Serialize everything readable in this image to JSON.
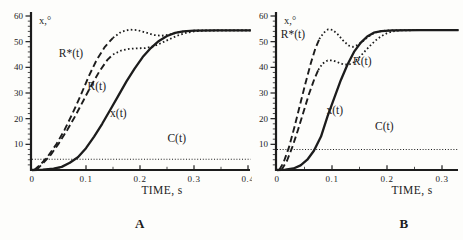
{
  "figure": {
    "background": "#fdfdfb",
    "ink": "#1c1c1c"
  },
  "chart_data": [
    {
      "type": "line",
      "panel_label": "A",
      "ylabel": "x,°",
      "xlabel": "TIME, s",
      "xlim": [
        0,
        0.4
      ],
      "ylim": [
        0,
        60
      ],
      "xtick_labels": [
        "0",
        "0.1",
        "0.2",
        "0.3",
        "0.4"
      ],
      "xtick_values": [
        0,
        0.1,
        0.2,
        0.3,
        0.4
      ],
      "ytick_labels": [
        "10",
        "20",
        "30",
        "40",
        "50",
        "60"
      ],
      "ytick_values": [
        10,
        20,
        30,
        40,
        50,
        60
      ],
      "x_minor_step": 0.05,
      "y_minor_step": 2,
      "steady_state_value": 54.4,
      "series": [
        {
          "name": "R*(t)",
          "segment": "rise",
          "style": "dashed",
          "points": [
            [
              0.004,
              0
            ],
            [
              0.015,
              2
            ],
            [
              0.03,
              5.5
            ],
            [
              0.045,
              10
            ],
            [
              0.06,
              15.5
            ],
            [
              0.075,
              22
            ],
            [
              0.09,
              29
            ],
            [
              0.105,
              36.5
            ],
            [
              0.12,
              43
            ],
            [
              0.135,
              48
            ],
            [
              0.15,
              51.5
            ]
          ]
        },
        {
          "name": "R*(t)",
          "segment": "settle",
          "style": "dotted",
          "points": [
            [
              0.15,
              51.5
            ],
            [
              0.165,
              53.8
            ],
            [
              0.18,
              54.7
            ],
            [
              0.195,
              54.5
            ],
            [
              0.21,
              53.6
            ],
            [
              0.225,
              52.6
            ],
            [
              0.24,
              52.3
            ],
            [
              0.255,
              52.8
            ],
            [
              0.27,
              53.6
            ],
            [
              0.285,
              54.1
            ],
            [
              0.31,
              54.4
            ],
            [
              0.35,
              54.4
            ],
            [
              0.405,
              54.4
            ]
          ]
        },
        {
          "name": "R(t)",
          "segment": "rise",
          "style": "dashed",
          "points": [
            [
              0.008,
              0
            ],
            [
              0.02,
              2.5
            ],
            [
              0.035,
              6
            ],
            [
              0.05,
              10.5
            ],
            [
              0.065,
              15.5
            ],
            [
              0.08,
              21
            ],
            [
              0.095,
              27
            ],
            [
              0.11,
              33
            ],
            [
              0.125,
              38.5
            ],
            [
              0.14,
              43
            ],
            [
              0.15,
              45
            ]
          ]
        },
        {
          "name": "R(t)",
          "segment": "settle",
          "style": "dotted",
          "points": [
            [
              0.15,
              45
            ],
            [
              0.165,
              46.5
            ],
            [
              0.18,
              47.2
            ],
            [
              0.195,
              47.4
            ],
            [
              0.21,
              47.5
            ],
            [
              0.225,
              48.2
            ],
            [
              0.24,
              49.5
            ],
            [
              0.255,
              51
            ],
            [
              0.27,
              52.4
            ],
            [
              0.285,
              53.4
            ],
            [
              0.3,
              54
            ],
            [
              0.32,
              54.3
            ],
            [
              0.36,
              54.4
            ],
            [
              0.405,
              54.4
            ]
          ]
        },
        {
          "name": "x(t)",
          "segment": "full",
          "style": "solid",
          "points": [
            [
              0,
              0
            ],
            [
              0.02,
              0.1
            ],
            [
              0.04,
              0.5
            ],
            [
              0.055,
              1.2
            ],
            [
              0.07,
              2.8
            ],
            [
              0.085,
              5
            ],
            [
              0.1,
              8.5
            ],
            [
              0.115,
              13
            ],
            [
              0.13,
              18
            ],
            [
              0.145,
              23.5
            ],
            [
              0.16,
              29
            ],
            [
              0.175,
              34.5
            ],
            [
              0.19,
              39.5
            ],
            [
              0.205,
              44
            ],
            [
              0.22,
              47.5
            ],
            [
              0.235,
              50.3
            ],
            [
              0.25,
              52.2
            ],
            [
              0.265,
              53.4
            ],
            [
              0.28,
              54
            ],
            [
              0.3,
              54.3
            ],
            [
              0.34,
              54.4
            ],
            [
              0.405,
              54.4
            ]
          ]
        },
        {
          "name": "C(t)",
          "segment": "full",
          "style": "cline",
          "points": [
            [
              0,
              4.2
            ],
            [
              0.405,
              4.2
            ]
          ]
        }
      ],
      "labels": [
        {
          "text": "R*(t)",
          "x": 0.072,
          "y": 44
        },
        {
          "text": "R(t)",
          "x": 0.12,
          "y": 31
        },
        {
          "text": "x(t)",
          "x": 0.16,
          "y": 20.5
        },
        {
          "text": "C(t)",
          "x": 0.268,
          "y": 11
        }
      ]
    },
    {
      "type": "line",
      "panel_label": "B",
      "ylabel": "x,°",
      "xlabel": "TIME, s",
      "xlim": [
        0,
        0.3
      ],
      "ylim": [
        0,
        60
      ],
      "xtick_labels": [
        "0",
        "0.1",
        "0.2",
        "0.3"
      ],
      "xtick_values": [
        0,
        0.1,
        0.2,
        0.3
      ],
      "ytick_labels": [
        "10",
        "20",
        "30",
        "40",
        "50",
        "60"
      ],
      "ytick_values": [
        10,
        20,
        30,
        40,
        50,
        60
      ],
      "x_minor_step": 0.05,
      "y_minor_step": 2,
      "steady_state_value": 54.5,
      "series": [
        {
          "name": "R*(t)",
          "segment": "rise",
          "style": "dashed",
          "points": [
            [
              0.004,
              0
            ],
            [
              0.012,
              3
            ],
            [
              0.022,
              9
            ],
            [
              0.032,
              17
            ],
            [
              0.042,
              25.5
            ],
            [
              0.052,
              34
            ],
            [
              0.062,
              42
            ],
            [
              0.07,
              47.5
            ],
            [
              0.077,
              51
            ]
          ]
        },
        {
          "name": "R*(t)",
          "segment": "settle",
          "style": "dotted",
          "points": [
            [
              0.077,
              51
            ],
            [
              0.085,
              53.5
            ],
            [
              0.093,
              54.8
            ],
            [
              0.101,
              54.6
            ],
            [
              0.11,
              53
            ],
            [
              0.12,
              50.5
            ],
            [
              0.13,
              48.5
            ],
            [
              0.138,
              48
            ],
            [
              0.147,
              48.7
            ],
            [
              0.156,
              50.2
            ],
            [
              0.165,
              51.8
            ],
            [
              0.175,
              53.2
            ],
            [
              0.185,
              54
            ],
            [
              0.2,
              54.4
            ],
            [
              0.24,
              54.5
            ],
            [
              0.33,
              54.5
            ]
          ]
        },
        {
          "name": "R(t)",
          "segment": "rise",
          "style": "dashed",
          "points": [
            [
              0.008,
              0
            ],
            [
              0.018,
              3.5
            ],
            [
              0.028,
              9
            ],
            [
              0.038,
              15.5
            ],
            [
              0.048,
              22.5
            ],
            [
              0.058,
              29.5
            ],
            [
              0.068,
              35.5
            ],
            [
              0.075,
              39
            ]
          ]
        },
        {
          "name": "R(t)",
          "segment": "settle",
          "style": "dotted",
          "points": [
            [
              0.075,
              39
            ],
            [
              0.083,
              41.5
            ],
            [
              0.092,
              42.7
            ],
            [
              0.101,
              42.7
            ],
            [
              0.11,
              42
            ],
            [
              0.12,
              41.2
            ],
            [
              0.13,
              41
            ],
            [
              0.14,
              42
            ],
            [
              0.15,
              44
            ],
            [
              0.16,
              46.3
            ],
            [
              0.17,
              48.6
            ],
            [
              0.18,
              50.6
            ],
            [
              0.19,
              52.2
            ],
            [
              0.2,
              53.3
            ],
            [
              0.21,
              54
            ],
            [
              0.225,
              54.4
            ],
            [
              0.26,
              54.5
            ],
            [
              0.33,
              54.5
            ]
          ]
        },
        {
          "name": "x(t)",
          "segment": "full",
          "style": "solid",
          "points": [
            [
              0,
              0
            ],
            [
              0.015,
              0.1
            ],
            [
              0.03,
              0.6
            ],
            [
              0.043,
              1.8
            ],
            [
              0.055,
              4
            ],
            [
              0.067,
              7.5
            ],
            [
              0.08,
              13
            ],
            [
              0.092,
              21
            ],
            [
              0.104,
              28
            ],
            [
              0.116,
              35
            ],
            [
              0.128,
              41
            ],
            [
              0.14,
              46
            ],
            [
              0.152,
              49.5
            ],
            [
              0.164,
              52
            ],
            [
              0.176,
              53.5
            ],
            [
              0.19,
              54.1
            ],
            [
              0.21,
              54.4
            ],
            [
              0.26,
              54.5
            ],
            [
              0.33,
              54.5
            ]
          ]
        },
        {
          "name": "C(t)",
          "segment": "full",
          "style": "cline",
          "points": [
            [
              0,
              8
            ],
            [
              0.33,
              8
            ]
          ]
        }
      ],
      "labels": [
        {
          "text": "R*(t)",
          "x": 0.029,
          "y": 51.5
        },
        {
          "text": "R(t)",
          "x": 0.155,
          "y": 41
        },
        {
          "text": "x(t)",
          "x": 0.105,
          "y": 22
        },
        {
          "text": "C(t)",
          "x": 0.195,
          "y": 15.5
        }
      ]
    }
  ]
}
